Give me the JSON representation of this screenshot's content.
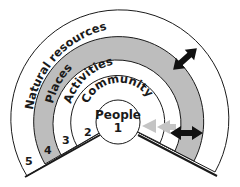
{
  "diagram": {
    "title": "",
    "colors": {
      "ring_fill": "#ffffff",
      "highlight_fill": "#bdbdbd",
      "stroke": "#1a1a1a",
      "arrow_dark": "#111111",
      "arrow_light": "#c4c4c4"
    },
    "center": {
      "label": "People",
      "number": "1"
    },
    "rings": [
      {
        "label": "Community",
        "number": "2",
        "highlighted": false
      },
      {
        "label": "Activities",
        "number": "3",
        "highlighted": false
      },
      {
        "label": "Places",
        "number": "4",
        "highlighted": true
      },
      {
        "label": "Natural resources",
        "number": "5",
        "highlighted": false
      }
    ],
    "arrows": [
      {
        "name": "double-arrow-places-to-natural-resources",
        "style": "dark"
      },
      {
        "name": "double-arrow-places-horizontal",
        "style": "dark"
      },
      {
        "name": "arrow-activities-to-people",
        "style": "light"
      },
      {
        "name": "arrow-community-to-people",
        "style": "light"
      }
    ]
  }
}
